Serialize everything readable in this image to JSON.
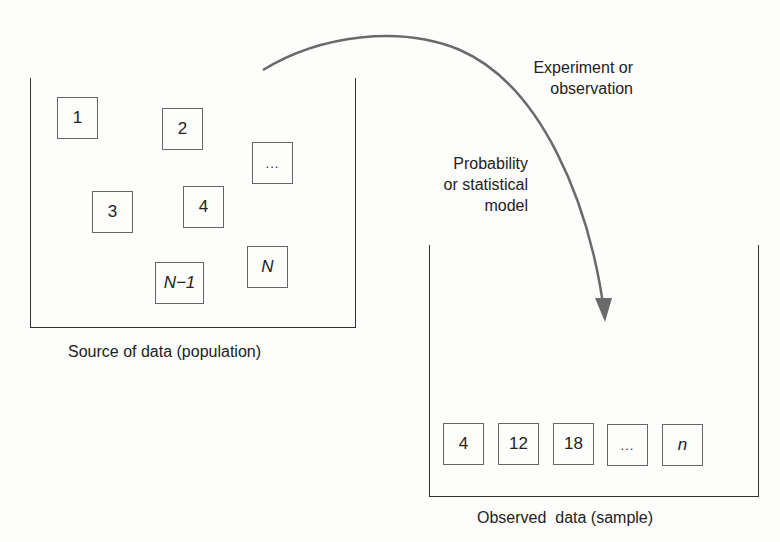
{
  "population": {
    "caption": "Source of data (population)",
    "items": [
      "1",
      "2",
      "...",
      "3",
      "4",
      "N−1",
      "N"
    ]
  },
  "sample": {
    "caption": "Observed  data (sample)",
    "items": [
      "4",
      "12",
      "18",
      "...",
      "n"
    ]
  },
  "arrow": {
    "label_top": "Experiment or\nobservation",
    "label_model": "Probability\nor statistical\nmodel",
    "color": "#6a6a6a"
  }
}
